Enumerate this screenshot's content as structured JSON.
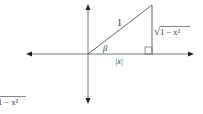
{
  "diagram": {
    "hypotenuse_label": "1",
    "angle_label": "β",
    "base_label": "|x|",
    "height_label": "1 − x²",
    "height_radical": "√",
    "cropped_label": "1 − x²",
    "colors": {
      "line": "#555555",
      "axis": "#333333"
    }
  }
}
